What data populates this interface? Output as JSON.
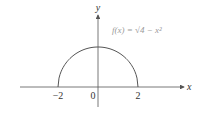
{
  "chart_data": {
    "type": "line",
    "title": "",
    "xlabel": "x",
    "ylabel": "y",
    "xlim": [
      -3.9,
      4.3
    ],
    "ylim": [
      -1.0,
      3.6
    ],
    "x_ticks": [
      {
        "value": -2,
        "label": "−2"
      },
      {
        "value": 0,
        "label": "0"
      },
      {
        "value": 2,
        "label": "2"
      }
    ],
    "annotation": {
      "text": "f(x) = √4 − x²",
      "x": 0.5,
      "y": 2.8
    },
    "series": [
      {
        "name": "f(x) = sqrt(4 - x^2)",
        "function": "sqrt(4 - x^2)",
        "domain": [
          -2,
          2
        ],
        "color": "#555555"
      }
    ],
    "grid": false,
    "axis_color": "#555555"
  }
}
